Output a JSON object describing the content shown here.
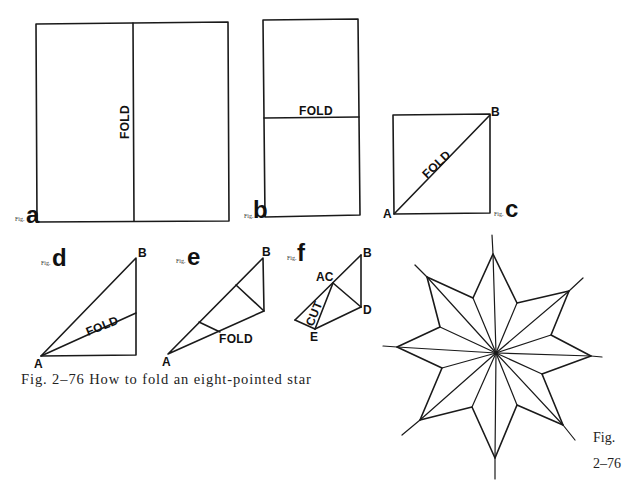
{
  "caption": "Fig. 2–76 How to fold an eight-pointed star",
  "side_caption": {
    "line1": "Fig.",
    "line2": "2–76"
  },
  "figures": {
    "a": {
      "prefix": "Fig.",
      "letter": "a",
      "fold_label": "FOLD"
    },
    "b": {
      "prefix": "Fig.",
      "letter": "b",
      "fold_label": "FOLD"
    },
    "c": {
      "prefix": "Fig.",
      "letter": "c",
      "fold_label": "FOLD",
      "point_a": "A",
      "point_b": "B"
    },
    "d": {
      "prefix": "Fig.",
      "letter": "d",
      "fold_label": "FOLD",
      "point_a": "A",
      "point_b": "B"
    },
    "e": {
      "prefix": "Fig.",
      "letter": "e",
      "fold_label": "FOLD",
      "point_a": "A",
      "point_b": "B"
    },
    "f": {
      "prefix": "Fig.",
      "letter": "f",
      "cut_label": "CUT",
      "point_b": "B",
      "point_ac": "AC",
      "point_d": "D",
      "point_e": "E"
    }
  },
  "star": {
    "points": 8,
    "description": "eight-pointed star result"
  },
  "colors": {
    "ink": "#1a1a1a",
    "paper": "#ffffff"
  }
}
